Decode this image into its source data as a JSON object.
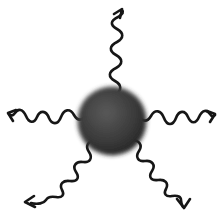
{
  "figure": {
    "background_color": "#ffffff",
    "width": 221,
    "height": 215,
    "alt_text": "A dark gray shaded sphere at the center with five squiggly sinusoidal arrows radiating outward"
  },
  "sphere": {
    "label": "nanoparticle-sphere",
    "center_x": 112,
    "center_y": 121,
    "radius": 34,
    "edge_color": "#1f1f1f",
    "core_color": "#3b3b3b",
    "highlight_color": "#5a5a5a",
    "blur_radius": 3
  },
  "stroke": {
    "color": "#151515",
    "width": 2.6
  },
  "waves": [
    {
      "id": "wave-top",
      "label": "wave-arrow-top",
      "direction": "up",
      "angle_deg": 270,
      "start_x": 117,
      "start_y": 88,
      "tip_x": 121,
      "tip_y": 8,
      "oscillations": 7,
      "amplitude": 7
    },
    {
      "id": "wave-upper-left",
      "label": "wave-arrow-upper-left",
      "direction": "up-left",
      "angle_deg": 200,
      "start_x": 82,
      "start_y": 105,
      "tip_x": 7,
      "tip_y": 63,
      "oscillations": 6,
      "amplitude": 7
    },
    {
      "id": "wave-upper-right",
      "label": "wave-arrow-upper-right",
      "direction": "up-right",
      "angle_deg": 340,
      "start_x": 142,
      "start_y": 106,
      "tip_x": 214,
      "tip_y": 64,
      "oscillations": 6,
      "amplitude": 7
    },
    {
      "id": "wave-lower-left",
      "label": "wave-arrow-lower-left",
      "direction": "down-left",
      "angle_deg": 160,
      "start_x": 86,
      "start_y": 146,
      "tip_x": 19,
      "tip_y": 190,
      "oscillations": 6,
      "amplitude": 7
    },
    {
      "id": "wave-lower-right",
      "label": "wave-arrow-lower-right",
      "direction": "down-right",
      "angle_deg": 55,
      "start_x": 138,
      "start_y": 145,
      "tip_x": 183,
      "tip_y": 207,
      "oscillations": 6,
      "amplitude": 7
    }
  ]
}
